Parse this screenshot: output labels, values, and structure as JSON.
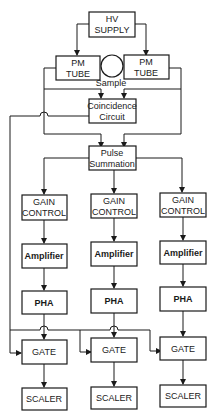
{
  "diagram": {
    "hv_supply": [
      "HV",
      "SUPPLY"
    ],
    "pm_tube_left": [
      "PM",
      "TUBE"
    ],
    "pm_tube_right": [
      "PM",
      "TUBE"
    ],
    "sample": "Sample",
    "coincidence": [
      "Coincidence",
      "Circuit"
    ],
    "pulse_summation": [
      "Pulse",
      "Summation"
    ],
    "channels": [
      {
        "gain": [
          "GAIN",
          "CONTROL"
        ],
        "amplifier": "Amplifier",
        "pha": "PHA",
        "gate": "GATE",
        "scaler": "SCALER"
      },
      {
        "gain": [
          "GAIN",
          "CONTROL"
        ],
        "amplifier": "Amplifier",
        "pha": "PHA",
        "gate": "GATE",
        "scaler": "SCALER"
      },
      {
        "gain": [
          "GAIN",
          "CONTROL"
        ],
        "amplifier": "Amplifier",
        "pha": "PHA",
        "gate": "GATE",
        "scaler": "SCALER"
      }
    ]
  }
}
